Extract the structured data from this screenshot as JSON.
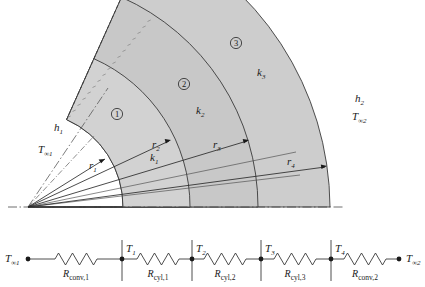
{
  "figure": {
    "colors": {
      "layer1_fill": "#d2d2d2",
      "layer2_fill": "#c8c8c8",
      "layer3_fill": "#cdcdcd",
      "outline": "#3a3a3a",
      "text": "#1a1a1a",
      "background": "#ffffff"
    }
  },
  "cylinder": {
    "layers": [
      {
        "number": "1",
        "conductivity": "k",
        "conductivity_sub": "1"
      },
      {
        "number": "2",
        "conductivity": "k",
        "conductivity_sub": "2"
      },
      {
        "number": "3",
        "conductivity": "k",
        "conductivity_sub": "3"
      }
    ],
    "radii": [
      {
        "symbol": "r",
        "sub": "1"
      },
      {
        "symbol": "r",
        "sub": "2"
      },
      {
        "symbol": "r",
        "sub": "3"
      },
      {
        "symbol": "r",
        "sub": "4"
      }
    ],
    "inner_convection": {
      "h": "h",
      "h_sub": "1",
      "T": "T",
      "T_sub": "∞1"
    },
    "outer_convection": {
      "h": "h",
      "h_sub": "2",
      "T": "T",
      "T_sub": "∞2"
    }
  },
  "network": {
    "nodes": [
      {
        "symbol": "T",
        "sub": "∞1"
      },
      {
        "symbol": "T",
        "sub": "1"
      },
      {
        "symbol": "T",
        "sub": "2"
      },
      {
        "symbol": "T",
        "sub": "3"
      },
      {
        "symbol": "T",
        "sub": "4"
      },
      {
        "symbol": "T",
        "sub": "∞2"
      }
    ],
    "resistors": [
      {
        "symbol": "R",
        "sub": "conv,1"
      },
      {
        "symbol": "R",
        "sub": "cyl,1"
      },
      {
        "symbol": "R",
        "sub": "cyl,2"
      },
      {
        "symbol": "R",
        "sub": "cyl,3"
      },
      {
        "symbol": "R",
        "sub": "conv,2"
      }
    ]
  }
}
